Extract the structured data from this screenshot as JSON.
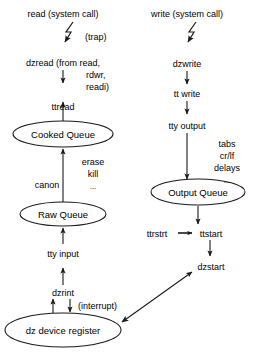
{
  "diagram": {
    "stroke_color": "#1a1a1a",
    "text_color": "#000000",
    "background": "#ffffff",
    "left_column": {
      "entry": "read (system call)",
      "trap_label": "(trap)",
      "driver_entry_line1": "dzread (from read,",
      "driver_entry_line2": "rdwr,",
      "driver_entry_line3": "readi)",
      "tt_routine": "ttread",
      "cooked_queue": "Cooked Queue",
      "canon": "canon",
      "canon_notes_line1": "erase",
      "canon_notes_line2": "kill",
      "canon_notes_line3": "...",
      "raw_queue": "Raw Queue",
      "tty_input": "tty input",
      "dzrint": "dzrint",
      "interrupt_label": "(interrupt)",
      "device_register": "dz device register"
    },
    "right_column": {
      "entry": "write (system call)",
      "driver_entry": "dzwrite",
      "tt_routine": "tt write",
      "tty_output": "tty output",
      "output_notes_line1": "tabs",
      "output_notes_line2": "cr/lf",
      "output_notes_line3": "delays",
      "output_notes_line4": "...",
      "output_queue": "Output Queue",
      "ttrstrt": "ttrstrt",
      "ttstart": "ttstart",
      "dzstart": "dzstart"
    }
  }
}
